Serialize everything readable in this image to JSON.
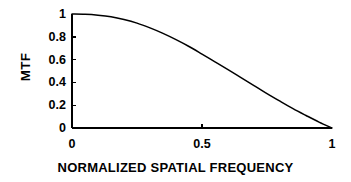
{
  "chart_data": {
    "type": "line",
    "title": "",
    "xlabel": "NORMALIZED SPATIAL FREQUENCY",
    "ylabel": "MTF",
    "xlim": [
      0,
      1
    ],
    "ylim": [
      0,
      1
    ],
    "grid": false,
    "legend": null,
    "xticks": [
      {
        "value": 0,
        "label": "0"
      },
      {
        "value": 0.5,
        "label": "0.5"
      },
      {
        "value": 1,
        "label": "1"
      }
    ],
    "yticks": [
      {
        "value": 1,
        "label": "1"
      },
      {
        "value": 0.8,
        "label": "0.8"
      },
      {
        "value": 0.6,
        "label": "0.6"
      },
      {
        "value": 0.4,
        "label": "0.4"
      },
      {
        "value": 0.2,
        "label": "0.2"
      },
      {
        "value": 0,
        "label": "0"
      }
    ],
    "series": [
      {
        "name": "MTF",
        "color": "#000000",
        "x": [
          0.0,
          0.05,
          0.1,
          0.15,
          0.2,
          0.25,
          0.3,
          0.35,
          0.4,
          0.45,
          0.5,
          0.55,
          0.6,
          0.65,
          0.7,
          0.75,
          0.8,
          0.85,
          0.9,
          0.95,
          1.0
        ],
        "y": [
          1.0,
          0.998,
          0.99,
          0.976,
          0.952,
          0.92,
          0.878,
          0.83,
          0.775,
          0.715,
          0.648,
          0.58,
          0.512,
          0.442,
          0.372,
          0.302,
          0.235,
          0.17,
          0.11,
          0.052,
          0.0
        ]
      }
    ],
    "axes_px": {
      "x0": 72,
      "x1": 332,
      "y0": 128,
      "y1": 14
    },
    "colors": {
      "axis": "#000000",
      "curve": "#000000",
      "background": "#ffffff"
    }
  }
}
